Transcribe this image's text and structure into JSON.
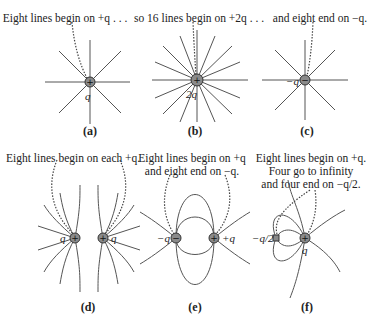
{
  "panels": [
    {
      "id": "a",
      "label": "(a)",
      "caption": [
        "Eight lines begin on +q . . ."
      ],
      "charges": [
        {
          "symbol": "+",
          "label": "q"
        }
      ],
      "lines": 8
    },
    {
      "id": "b",
      "label": "(b)",
      "caption": [
        "so 16 lines begin on +2q . . ."
      ],
      "charges": [
        {
          "symbol": "+",
          "label": "2q"
        }
      ],
      "lines": 16
    },
    {
      "id": "c",
      "label": "(c)",
      "caption": [
        "and eight end on −q."
      ],
      "charges": [
        {
          "symbol": "−",
          "label": "−q"
        }
      ],
      "lines": 8
    },
    {
      "id": "d",
      "label": "(d)",
      "caption": [
        "Eight lines begin on each +q."
      ],
      "charges": [
        {
          "symbol": "+",
          "label": "q"
        },
        {
          "symbol": "+",
          "label": "q"
        }
      ]
    },
    {
      "id": "e",
      "label": "(e)",
      "caption": [
        "Eight lines begin on +q",
        "and eight end on −q."
      ],
      "charges": [
        {
          "symbol": "−",
          "label": "−q"
        },
        {
          "symbol": "+",
          "label": "+q"
        }
      ]
    },
    {
      "id": "f",
      "label": "(f)",
      "caption": [
        "Eight lines begin on +q.",
        "Four go to infinity",
        "and four end on −q/2."
      ],
      "charges": [
        {
          "symbol": "−",
          "label": "−q/2"
        },
        {
          "symbol": "+",
          "label": "q"
        }
      ]
    }
  ],
  "colors": {
    "line": "#555555",
    "charge_fill": "#8a8a8a",
    "dotted": "#444444"
  }
}
